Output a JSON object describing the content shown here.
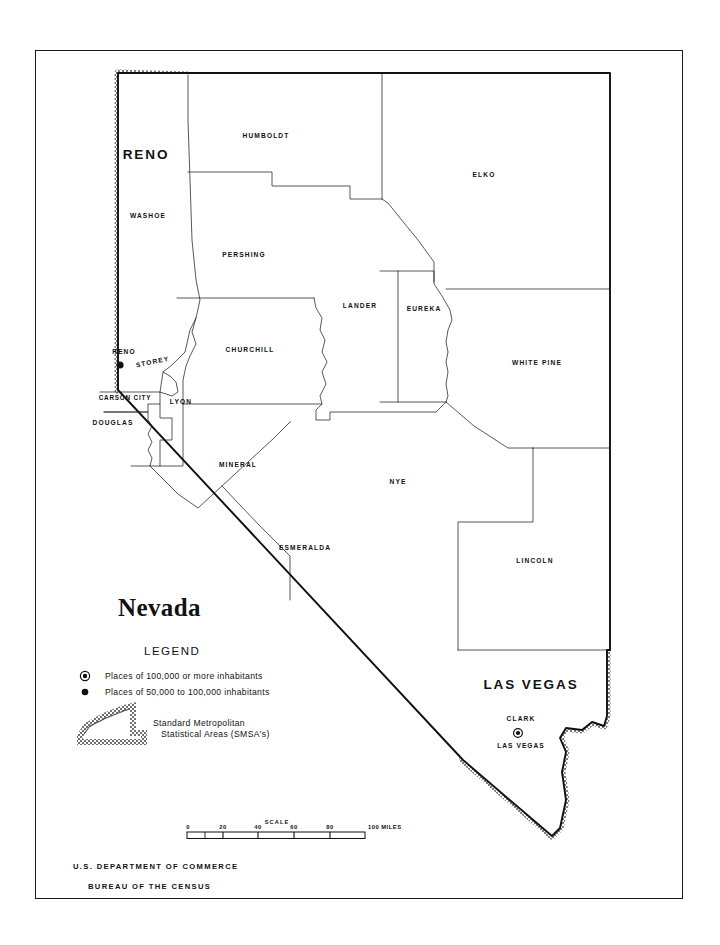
{
  "document": {
    "title": "Nevada",
    "agency_line_1": "U.S. DEPARTMENT OF COMMERCE",
    "agency_line_2": "BUREAU OF THE CENSUS"
  },
  "legend": {
    "heading": "LEGEND",
    "items": [
      {
        "symbol": "circled-dot",
        "label": "Places of 100,000 or more inhabitants"
      },
      {
        "symbol": "filled-dot",
        "label": "Places of 50,000 to 100,000 inhabitants"
      }
    ],
    "smsa": {
      "symbol": "smsa-band-swatch",
      "label_line_1": "Standard Metropolitan",
      "label_line_2": "Statistical Areas (SMSA's)"
    }
  },
  "scale": {
    "title": "SCALE",
    "ticks": [
      "0",
      "20",
      "40",
      "60",
      "80",
      "100"
    ],
    "units": "MILES",
    "unit_suffix_label": "100  MILES"
  },
  "map": {
    "state": "Nevada",
    "counties": [
      {
        "name": "WASHOE",
        "x": 148,
        "y": 218
      },
      {
        "name": "HUMBOLDT",
        "x": 266,
        "y": 138
      },
      {
        "name": "ELKO",
        "x": 484,
        "y": 177
      },
      {
        "name": "PERSHING",
        "x": 244,
        "y": 257
      },
      {
        "name": "LANDER",
        "x": 360,
        "y": 308
      },
      {
        "name": "EUREKA",
        "x": 424,
        "y": 311
      },
      {
        "name": "WHITE PINE",
        "x": 537,
        "y": 365
      },
      {
        "name": "CHURCHILL",
        "x": 250,
        "y": 352
      },
      {
        "name": "STOREY",
        "x": 153,
        "y": 364
      },
      {
        "name": "CARSON CITY",
        "x": 125,
        "y": 400
      },
      {
        "name": "DOUGLAS",
        "x": 113,
        "y": 425
      },
      {
        "name": "LYON",
        "x": 181,
        "y": 404
      },
      {
        "name": "MINERAL",
        "x": 238,
        "y": 467
      },
      {
        "name": "ESMERALDA",
        "x": 305,
        "y": 550
      },
      {
        "name": "NYE",
        "x": 398,
        "y": 484
      },
      {
        "name": "LINCOLN",
        "x": 535,
        "y": 563
      },
      {
        "name": "CLARK",
        "x": 521,
        "y": 721
      }
    ],
    "smsa_areas": [
      {
        "name": "RENO",
        "x": 146,
        "y": 159,
        "size": "large"
      },
      {
        "name": "LAS VEGAS",
        "x": 531,
        "y": 689,
        "size": "large"
      }
    ],
    "cities": [
      {
        "name": "RENO",
        "label_x": 124,
        "label_y": 354,
        "dot_x": 120,
        "dot_y": 365,
        "symbol": "filled-dot"
      },
      {
        "name": "LAS VEGAS",
        "label_x": 521,
        "label_y": 748,
        "dot_x": 518,
        "dot_y": 733,
        "symbol": "circled-dot"
      }
    ]
  },
  "colors": {
    "ink": "#111111",
    "paper": "#ffffff",
    "smsa_band": "#8c8c8c",
    "frame": "#1a1a1a"
  }
}
